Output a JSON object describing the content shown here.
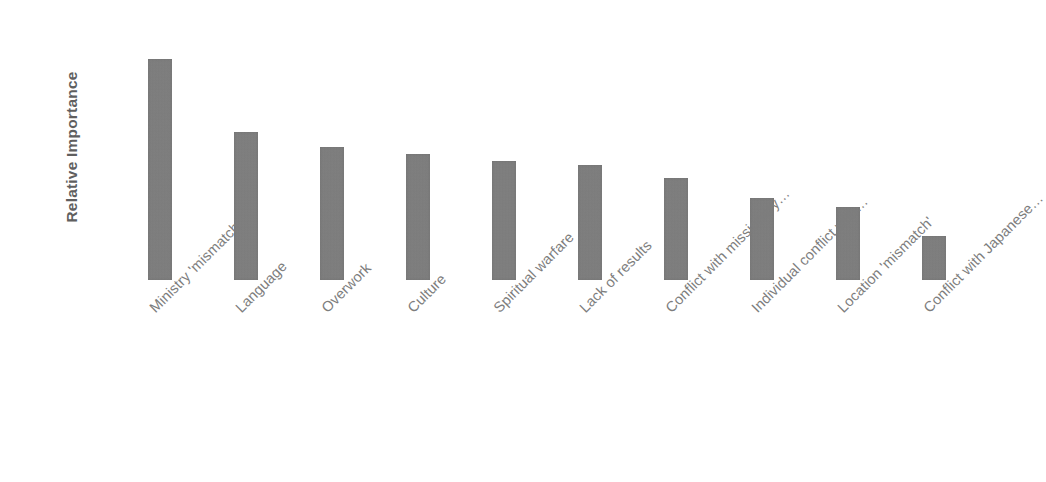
{
  "chart_data": {
    "type": "bar",
    "title": "",
    "subtitle": "",
    "xlabel": "",
    "ylabel": "Relative Importance",
    "grid": false,
    "legend": false,
    "axis_tick_labels_rotated_deg": -45,
    "bar_color": "#7c7c7c",
    "label_color": "#7d7d7d",
    "ylim": [
      0,
      100
    ],
    "y_tick_labels": [],
    "categories": [
      "Ministry 'mismatch'",
      "Language",
      "Overwork",
      "Culture",
      "Spiritual warfare",
      "Lack of results",
      "Conflict with missionary…",
      "Individual conflict with…",
      "Location 'mismatch'",
      "Conflict with Japanese…"
    ],
    "values": [
      100,
      67,
      60,
      57,
      54,
      52,
      46,
      37,
      33,
      20
    ]
  },
  "axes": {
    "y_title": "Relative Importance"
  },
  "bars": [
    {
      "label": "Ministry 'mismatch'",
      "value": 100
    },
    {
      "label": "Language",
      "value": 67
    },
    {
      "label": "Overwork",
      "value": 60
    },
    {
      "label": "Culture",
      "value": 57
    },
    {
      "label": "Spiritual warfare",
      "value": 54
    },
    {
      "label": "Lack of results",
      "value": 52
    },
    {
      "label": "Conflict with missionary…",
      "value": 46
    },
    {
      "label": "Individual conflict with…",
      "value": 37
    },
    {
      "label": "Location 'mismatch'",
      "value": 33
    },
    {
      "label": "Conflict with Japanese…",
      "value": 20
    }
  ]
}
